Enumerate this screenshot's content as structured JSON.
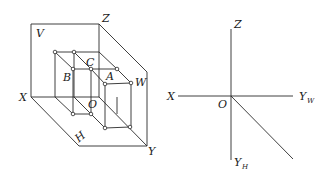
{
  "figure": {
    "left": {
      "title": "Three-plane projection system (pictorial view)",
      "plane_labels": {
        "V": "V",
        "H": "H",
        "W": "W"
      },
      "axis_labels": {
        "X": "X",
        "Y": "Y",
        "Z": "Z",
        "O": "O"
      },
      "point_labels": {
        "A": "A",
        "B": "B",
        "C": "C"
      }
    },
    "right": {
      "title": "Unfolded projection axes",
      "axis_labels": {
        "X": "X",
        "Z": "Z",
        "O": "O",
        "Y": "Y",
        "YW_sub": "W",
        "YH_sub": "H"
      }
    }
  },
  "colors": {
    "line": "#2a2a2a",
    "background": "#ffffff"
  }
}
